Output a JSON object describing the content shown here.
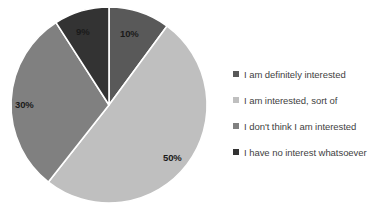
{
  "chart_data": {
    "type": "pie",
    "title": "",
    "categories": [
      "I am definitely interested",
      "I am interested, sort of",
      "I don't think I am interested",
      "I have no interest whatsoever"
    ],
    "values": [
      10,
      50,
      30,
      9
    ],
    "data_labels": [
      "10%",
      "50%",
      "30%",
      "9%"
    ],
    "colors": [
      "#595959",
      "#bfbfbf",
      "#808080",
      "#333333"
    ],
    "start_angle_deg": 0,
    "direction": "clockwise",
    "legend_position": "right",
    "grid": false,
    "slice_border_color": "#ffffff"
  },
  "legend": {
    "items": [
      {
        "label": "I am definitely interested",
        "color": "#595959"
      },
      {
        "label": "I am interested, sort of",
        "color": "#bfbfbf"
      },
      {
        "label": "I don't think I am interested",
        "color": "#808080"
      },
      {
        "label": "I have no interest whatsoever",
        "color": "#333333"
      }
    ]
  },
  "labels": {
    "slice_1": "10%",
    "slice_2": "50%",
    "slice_3": "30%",
    "slice_4": "9%"
  }
}
